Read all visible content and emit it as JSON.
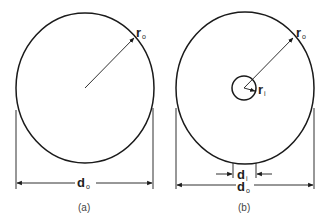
{
  "figures": [
    {
      "id": "a",
      "caption": "(a)",
      "shape": "solid circular shaft cross-section",
      "labels": {
        "outer_radius": {
          "main": "r",
          "sub": "o"
        },
        "outer_diameter": {
          "main": "d",
          "sub": "o"
        }
      }
    },
    {
      "id": "b",
      "caption": "(b)",
      "shape": "hollow circular shaft cross-section",
      "labels": {
        "outer_radius": {
          "main": "r",
          "sub": "o"
        },
        "inner_radius": {
          "main": "r",
          "sub": "i"
        },
        "inner_diameter": {
          "main": "d",
          "sub": "i"
        },
        "outer_diameter": {
          "main": "d",
          "sub": "o"
        }
      }
    }
  ],
  "colors": {
    "stroke": "#1a1a1a",
    "text": "#222222",
    "caption": "#444444"
  }
}
